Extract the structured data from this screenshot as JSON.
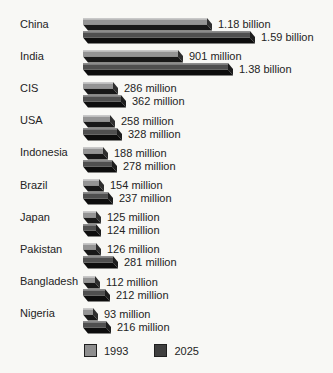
{
  "chart_data": {
    "type": "bar",
    "orientation": "horizontal",
    "title": "",
    "unit": "millions of people",
    "categories": [
      "China",
      "India",
      "CIS",
      "USA",
      "Indonesia",
      "Brazil",
      "Japan",
      "Pakistan",
      "Bangladesh",
      "Nigeria"
    ],
    "series": [
      {
        "name": "1993",
        "values": [
          1180,
          901,
          286,
          258,
          188,
          154,
          125,
          126,
          112,
          93
        ],
        "labels": [
          "1.18 billion",
          "901 million",
          "286 million",
          "258 million",
          "188 million",
          "154 million",
          "125 million",
          "126 million",
          "112 million",
          "93 million"
        ],
        "face_color": "#949494",
        "highlight_color": "#c9c9c9",
        "side_color": "#2e2e2e",
        "shadow_color": "#181818",
        "legend_color": "#8e8e8e"
      },
      {
        "name": "2025",
        "values": [
          1590,
          1380,
          362,
          328,
          278,
          237,
          124,
          281,
          212,
          216
        ],
        "labels": [
          "1.59 billion",
          "1.38 billion",
          "362 million",
          "328 million",
          "278 million",
          "237 million",
          "124 million",
          "281 million",
          "212 million",
          "216 million"
        ],
        "face_color": "#4f4f4f",
        "highlight_color": "#8c8c8c",
        "side_color": "#1d1d1d",
        "shadow_color": "#0d0d0d",
        "legend_color": "#3f3f3f"
      }
    ],
    "legend_position": "bottom",
    "axis": {
      "gridlines": false,
      "value_axis_shown": false
    },
    "style": "3d-extruded-bars"
  }
}
